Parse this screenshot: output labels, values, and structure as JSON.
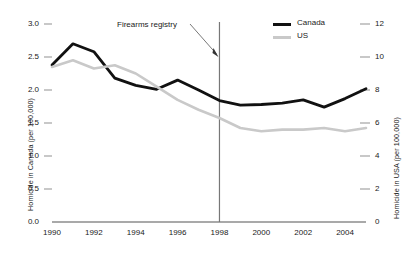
{
  "chart_data": {
    "type": "line",
    "title": "",
    "xlabel": "",
    "ylabel": "Homicide in Canada (per 100,000)",
    "y2label": "Homicide in USA (per 100,000)",
    "x": [
      1990,
      1991,
      1992,
      1993,
      1994,
      1995,
      1996,
      1997,
      1998,
      1999,
      2000,
      2001,
      2002,
      2003,
      2004,
      2005
    ],
    "xlim": [
      1990,
      2005
    ],
    "ylim": [
      0.0,
      3.0
    ],
    "y2lim": [
      0,
      12
    ],
    "grid": false,
    "legend_position": "top-right",
    "xticks": [
      "1990",
      "1992",
      "1994",
      "1996",
      "1998",
      "2000",
      "2002",
      "2004"
    ],
    "xtick_values": [
      1990,
      1992,
      1994,
      1996,
      1998,
      2000,
      2002,
      2004
    ],
    "yticks_left": [
      "0.0",
      "0.5",
      "1.0",
      "1.5",
      "2.0",
      "2.5",
      "3.0"
    ],
    "ytick_left_values": [
      0.0,
      0.5,
      1.0,
      1.5,
      2.0,
      2.5,
      3.0
    ],
    "yticks_right": [
      "0",
      "2",
      "4",
      "6",
      "8",
      "10",
      "12"
    ],
    "ytick_right_values": [
      0,
      2,
      4,
      6,
      8,
      10,
      12
    ],
    "series": [
      {
        "name": "Canada",
        "axis": "left",
        "color": "#111111",
        "values": [
          2.38,
          2.7,
          2.58,
          2.18,
          2.07,
          2.01,
          2.15,
          2.0,
          1.84,
          1.77,
          1.78,
          1.8,
          1.85,
          1.74,
          1.87,
          2.02
        ]
      },
      {
        "name": "US",
        "axis": "right",
        "color": "#c9c9c9",
        "values": [
          9.4,
          9.8,
          9.3,
          9.5,
          9.0,
          8.2,
          7.4,
          6.8,
          6.3,
          5.7,
          5.5,
          5.6,
          5.6,
          5.7,
          5.5,
          5.7
        ]
      }
    ],
    "annotations": [
      {
        "text": "Firearms registry",
        "x": 1998,
        "type": "vertical-line-with-arrow",
        "line_color": "#777777"
      }
    ]
  },
  "legend": {
    "canada": "Canada",
    "us": "US"
  },
  "axes": {
    "left_title": "Homicide in Canada (per 100,000)",
    "right_title": "Homicide in USA (per 100,000)"
  },
  "annotation": {
    "firearms_registry": "Firearms registry"
  }
}
